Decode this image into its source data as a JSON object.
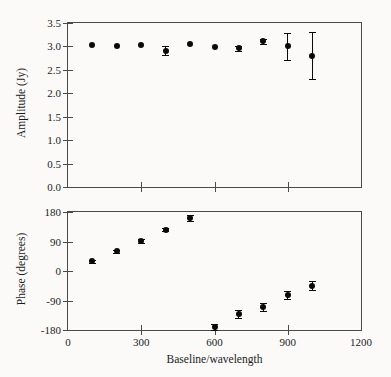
{
  "figure": {
    "width": 391,
    "height": 377,
    "background": "#fbfaf8",
    "marker_color": "#0a0a0a",
    "axis_color": "#4a4a4a"
  },
  "chart_data": [
    {
      "id": "amplitude",
      "type": "scatter",
      "title": "",
      "xlabel": "",
      "ylabel": "Amplitude (Jy)",
      "xlim": [
        0,
        1200
      ],
      "ylim": [
        0.0,
        3.5
      ],
      "xticks": [
        0,
        300,
        600,
        900,
        1200
      ],
      "xticklabels": [
        "0",
        "300",
        "600",
        "900",
        "1200"
      ],
      "xticklabels_visible": false,
      "yticks": [
        0.0,
        0.5,
        1.0,
        1.5,
        2.0,
        2.5,
        3.0,
        3.5
      ],
      "yticklabels": [
        "0.0",
        "0.5",
        "1.0",
        "1.5",
        "2.0",
        "2.5",
        "3.0",
        "3.5"
      ],
      "grid": false,
      "legend": null,
      "x": [
        100,
        200,
        300,
        400,
        500,
        600,
        700,
        800,
        900,
        1000
      ],
      "y": [
        3.03,
        3.01,
        3.04,
        2.91,
        3.05,
        2.98,
        2.96,
        3.11,
        3.0,
        2.8
      ],
      "yerr": [
        0.02,
        0.02,
        0.02,
        0.1,
        0.03,
        0.03,
        0.05,
        0.05,
        0.28,
        0.5
      ]
    },
    {
      "id": "phase",
      "type": "scatter",
      "title": "",
      "xlabel": "Baseline/wavelength",
      "ylabel": "Phase (degrees)",
      "xlim": [
        0,
        1200
      ],
      "ylim": [
        -180,
        180
      ],
      "xticks": [
        0,
        300,
        600,
        900,
        1200
      ],
      "xticklabels": [
        "0",
        "300",
        "600",
        "900",
        "1200"
      ],
      "xticklabels_visible": true,
      "yticks": [
        -180,
        -90,
        0,
        90,
        180
      ],
      "yticklabels": [
        "-180",
        "-90",
        "0",
        "90",
        "180"
      ],
      "grid": false,
      "legend": null,
      "x": [
        100,
        200,
        300,
        400,
        500,
        600,
        700,
        800,
        900,
        1000
      ],
      "y": [
        30,
        60,
        92,
        126,
        163,
        -172,
        -131,
        -110,
        -72,
        -45
      ],
      "yerr": [
        5,
        5,
        7,
        5,
        9,
        9,
        13,
        13,
        12,
        14
      ]
    }
  ]
}
